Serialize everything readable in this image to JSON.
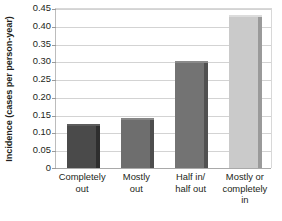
{
  "chart_data": {
    "type": "bar",
    "title": "",
    "subtitle": "",
    "xlabel": "",
    "ylabel": "Incidence (cases per person-year)",
    "categories": [
      "Completely out",
      "Mostly out",
      "Half in/ half out",
      "Mostly or completely in"
    ],
    "category_lines": [
      [
        "Completely",
        "out"
      ],
      [
        "Mostly",
        "out"
      ],
      [
        "Half in/",
        "half out"
      ],
      [
        "Mostly or",
        "completely in"
      ]
    ],
    "values": [
      0.125,
      0.14,
      0.3,
      0.43
    ],
    "ylim": [
      0,
      0.45
    ],
    "ytick_labels": [
      "0",
      "0.05",
      "0.10",
      "0.15",
      "0.20",
      "0.25",
      "0.30",
      "0.35",
      "0.40",
      "0.45"
    ],
    "ytick_values": [
      0,
      0.05,
      0.1,
      0.15,
      0.2,
      0.25,
      0.3,
      0.35,
      0.4,
      0.45
    ],
    "grid": true,
    "legend": "none",
    "bar_colors": [
      "#4a4a4a",
      "#6e6e6e",
      "#737373",
      "#cacaca"
    ],
    "bar_side_colors": [
      "#2e2e2e",
      "#4d4d4d",
      "#515151",
      "#9a9a9a"
    ],
    "bar_top_colors": [
      "#5c5c5c",
      "#868686",
      "#8a8a8a",
      "#dcdcdc"
    ],
    "gridline_color": "#d3d3d3",
    "axis_color": "#a9a9a9"
  },
  "footer": {
    "cut_text": ""
  }
}
